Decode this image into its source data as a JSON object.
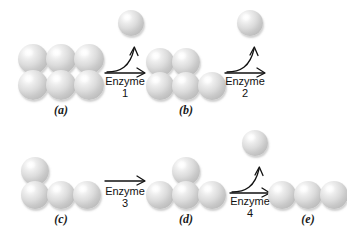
{
  "figure": {
    "background_color": "#ffffff",
    "sphere_color": "#c9c9c9",
    "outline_color": "#1a1a1a"
  },
  "groups": [
    {
      "id": "a",
      "label": "(a)",
      "shape": "2x3-block",
      "sphere_count": 6,
      "description": "six spheres arranged in two rows of three"
    },
    {
      "id": "b",
      "label": "(b)",
      "shape": "stepped",
      "sphere_count": 5,
      "description": "two spheres on top row left, three spheres on bottom row"
    },
    {
      "id": "c",
      "label": "(c)",
      "shape": "L-shape",
      "sphere_count": 4,
      "description": "three spheres in a row with one sphere atop the leftmost"
    },
    {
      "id": "d",
      "label": "(d)",
      "shape": "T-shape",
      "sphere_count": 4,
      "description": "three spheres in a row with one sphere atop the middle"
    },
    {
      "id": "e",
      "label": "(e)",
      "shape": "linear",
      "sphere_count": 3,
      "description": "three spheres in a horizontal row"
    }
  ],
  "reactions": [
    {
      "id": "1",
      "enzyme_label": "Enzyme",
      "enzyme_number": "1",
      "arrow_type": "branched",
      "releases_product": true,
      "product_count": 1
    },
    {
      "id": "2",
      "enzyme_label": "Enzyme",
      "enzyme_number": "2",
      "arrow_type": "branched",
      "releases_product": true,
      "product_count": 1
    },
    {
      "id": "3",
      "enzyme_label": "Enzyme",
      "enzyme_number": "3",
      "arrow_type": "straight",
      "releases_product": false,
      "product_count": 0
    },
    {
      "id": "4",
      "enzyme_label": "Enzyme",
      "enzyme_number": "4",
      "arrow_type": "branched",
      "releases_product": true,
      "product_count": 1
    }
  ],
  "released_products": [
    {
      "id": "p1",
      "after_reaction": "1",
      "sphere_count": 1
    },
    {
      "id": "p2",
      "after_reaction": "2",
      "sphere_count": 1
    },
    {
      "id": "p4",
      "after_reaction": "4",
      "sphere_count": 1
    }
  ]
}
